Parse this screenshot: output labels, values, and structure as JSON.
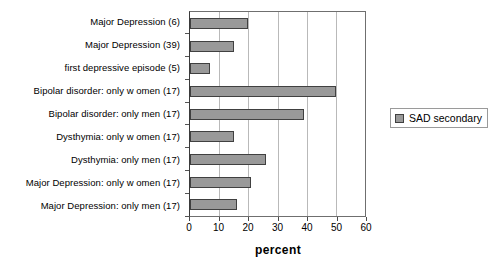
{
  "chart_data": {
    "type": "bar",
    "orientation": "horizontal",
    "title": "",
    "xlabel": "percent",
    "ylabel": "",
    "xlim": [
      0,
      60
    ],
    "xticks": [
      0,
      10,
      20,
      30,
      40,
      50,
      60
    ],
    "grid": true,
    "legend_position": "right",
    "categories": [
      "Major Depression (6)",
      "Major Depression (39)",
      "first depressive episode (5)",
      "Bipolar disorder: only w omen (17)",
      "Bipolar disorder: only men (17)",
      "Dysthymia: only w omen (17)",
      "Dysthymia: only men (17)",
      "Major Depression: only w omen (17)",
      "Major Depression: only men (17)"
    ],
    "series": [
      {
        "name": "SAD secondary",
        "color": "#999999",
        "values": [
          20,
          15,
          7,
          50,
          39,
          15,
          26,
          21,
          16
        ]
      }
    ]
  },
  "legend": {
    "entries": [
      {
        "label": "SAD secondary",
        "color": "#999999"
      }
    ]
  },
  "axis": {
    "x_title": "percent",
    "tick_labels": [
      "0",
      "10",
      "20",
      "30",
      "40",
      "50",
      "60"
    ]
  }
}
